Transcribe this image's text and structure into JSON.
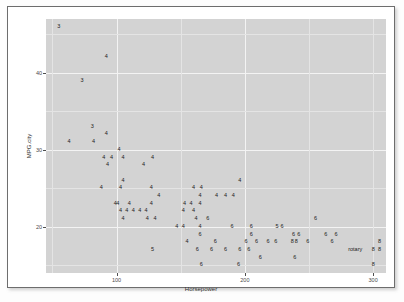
{
  "chart_data": {
    "type": "scatter",
    "title": "",
    "xlabel": "Horsepower",
    "ylabel": "MPG.city",
    "xlim": [
      45,
      310
    ],
    "ylim": [
      14,
      47
    ],
    "xticks": [
      100,
      200,
      300
    ],
    "xtick_labels": [
      "100",
      "200",
      "300"
    ],
    "yticks": [
      20,
      30,
      40
    ],
    "ytick_labels": [
      "20",
      "30",
      "40"
    ],
    "grid": true,
    "legend": "none",
    "marker_style": "text-label",
    "marker_encodes": "Cylinders",
    "panel_color": "#d3d3d3",
    "grid_color": "#f3f3f3",
    "text_color": "#1b1b1b",
    "points": [
      {
        "x": 55,
        "y": 46,
        "label": "3"
      },
      {
        "x": 92,
        "y": 42,
        "label": "4"
      },
      {
        "x": 73,
        "y": 39,
        "label": "3"
      },
      {
        "x": 81,
        "y": 33,
        "label": "3"
      },
      {
        "x": 63,
        "y": 31,
        "label": "4"
      },
      {
        "x": 82,
        "y": 31,
        "label": "4"
      },
      {
        "x": 92,
        "y": 32,
        "label": "4"
      },
      {
        "x": 102,
        "y": 30,
        "label": "4"
      },
      {
        "x": 90,
        "y": 29,
        "label": "4"
      },
      {
        "x": 96,
        "y": 29,
        "label": "4"
      },
      {
        "x": 105,
        "y": 29,
        "label": "4"
      },
      {
        "x": 93,
        "y": 28,
        "label": "4"
      },
      {
        "x": 128,
        "y": 29,
        "label": "4"
      },
      {
        "x": 121,
        "y": 28,
        "label": "4"
      },
      {
        "x": 105,
        "y": 26,
        "label": "4"
      },
      {
        "x": 88,
        "y": 25,
        "label": "4"
      },
      {
        "x": 103,
        "y": 25,
        "label": "4"
      },
      {
        "x": 127,
        "y": 25,
        "label": "4"
      },
      {
        "x": 160,
        "y": 25,
        "label": "4"
      },
      {
        "x": 166,
        "y": 25,
        "label": "4"
      },
      {
        "x": 196,
        "y": 26,
        "label": "4"
      },
      {
        "x": 133,
        "y": 24,
        "label": "4"
      },
      {
        "x": 165,
        "y": 24,
        "label": "4"
      },
      {
        "x": 178,
        "y": 24,
        "label": "4"
      },
      {
        "x": 185,
        "y": 24,
        "label": "4"
      },
      {
        "x": 191,
        "y": 24,
        "label": "4"
      },
      {
        "x": 99,
        "y": 23,
        "label": "4"
      },
      {
        "x": 101,
        "y": 23,
        "label": "4"
      },
      {
        "x": 110,
        "y": 23,
        "label": "4"
      },
      {
        "x": 127,
        "y": 23,
        "label": "4"
      },
      {
        "x": 153,
        "y": 23,
        "label": "4"
      },
      {
        "x": 158,
        "y": 23,
        "label": "4"
      },
      {
        "x": 165,
        "y": 23,
        "label": "4"
      },
      {
        "x": 103,
        "y": 22,
        "label": "4"
      },
      {
        "x": 108,
        "y": 22,
        "label": "4"
      },
      {
        "x": 113,
        "y": 22,
        "label": "4"
      },
      {
        "x": 118,
        "y": 22,
        "label": "4"
      },
      {
        "x": 123,
        "y": 22,
        "label": "4"
      },
      {
        "x": 152,
        "y": 22,
        "label": "4"
      },
      {
        "x": 160,
        "y": 22,
        "label": "4"
      },
      {
        "x": 105,
        "y": 21,
        "label": "4"
      },
      {
        "x": 124,
        "y": 21,
        "label": "4"
      },
      {
        "x": 130,
        "y": 21,
        "label": "4"
      },
      {
        "x": 162,
        "y": 21,
        "label": "4"
      },
      {
        "x": 171,
        "y": 21,
        "label": "6"
      },
      {
        "x": 147,
        "y": 20,
        "label": "4"
      },
      {
        "x": 152,
        "y": 20,
        "label": "4"
      },
      {
        "x": 165,
        "y": 20,
        "label": "4"
      },
      {
        "x": 190,
        "y": 20,
        "label": "6"
      },
      {
        "x": 205,
        "y": 20,
        "label": "6"
      },
      {
        "x": 225,
        "y": 20,
        "label": "5"
      },
      {
        "x": 229,
        "y": 20,
        "label": "6"
      },
      {
        "x": 255,
        "y": 21,
        "label": "6"
      },
      {
        "x": 165,
        "y": 19,
        "label": "6"
      },
      {
        "x": 205,
        "y": 19,
        "label": "6"
      },
      {
        "x": 238,
        "y": 19,
        "label": "6"
      },
      {
        "x": 242,
        "y": 19,
        "label": "6"
      },
      {
        "x": 263,
        "y": 19,
        "label": "6"
      },
      {
        "x": 271,
        "y": 19,
        "label": "6"
      },
      {
        "x": 155,
        "y": 18,
        "label": "4"
      },
      {
        "x": 177,
        "y": 18,
        "label": "6"
      },
      {
        "x": 201,
        "y": 18,
        "label": "6"
      },
      {
        "x": 209,
        "y": 18,
        "label": "6"
      },
      {
        "x": 218,
        "y": 18,
        "label": "6"
      },
      {
        "x": 224,
        "y": 18,
        "label": "6"
      },
      {
        "x": 237,
        "y": 18,
        "label": "8"
      },
      {
        "x": 240,
        "y": 18,
        "label": "8"
      },
      {
        "x": 249,
        "y": 18,
        "label": "6"
      },
      {
        "x": 268,
        "y": 18,
        "label": "6"
      },
      {
        "x": 128,
        "y": 17,
        "label": "5"
      },
      {
        "x": 163,
        "y": 17,
        "label": "6"
      },
      {
        "x": 174,
        "y": 17,
        "label": "6"
      },
      {
        "x": 185,
        "y": 17,
        "label": "6"
      },
      {
        "x": 196,
        "y": 17,
        "label": "6"
      },
      {
        "x": 203,
        "y": 17,
        "label": "6"
      },
      {
        "x": 212,
        "y": 16,
        "label": "6"
      },
      {
        "x": 239,
        "y": 16,
        "label": "6"
      },
      {
        "x": 166,
        "y": 15,
        "label": "6"
      },
      {
        "x": 195,
        "y": 15,
        "label": "6"
      },
      {
        "x": 286,
        "y": 17,
        "label": "rotary"
      },
      {
        "x": 300,
        "y": 17,
        "label": "8"
      },
      {
        "x": 300,
        "y": 15,
        "label": "8"
      },
      {
        "x": 305,
        "y": 18,
        "label": "8"
      },
      {
        "x": 305,
        "y": 17,
        "label": "8"
      }
    ]
  }
}
